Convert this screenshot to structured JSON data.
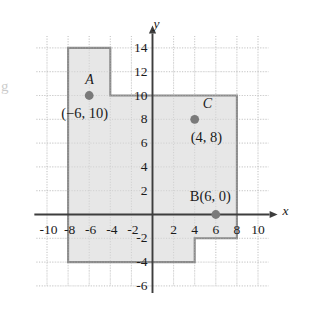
{
  "figure": {
    "axis_labels": {
      "x": "x",
      "y": "y"
    },
    "x_ticks": [
      "-10",
      "-8",
      "-6",
      "-4",
      "-2",
      "2",
      "4",
      "6",
      "8",
      "10"
    ],
    "y_ticks": [
      "14",
      "12",
      "10",
      "8",
      "6",
      "4",
      "2",
      "-2",
      "-4",
      "-6"
    ],
    "colors": {
      "shade_fill": "#e6e6e6",
      "polygon_stroke": "#8a8a8a",
      "axis": "#3d3d3d",
      "grid": "#c8c8c8",
      "point": "#7a7a7a",
      "text": "#1a1a1a"
    },
    "points": [
      {
        "name": "A",
        "coord_label": "(−6, 10)",
        "x": -6,
        "y": 10
      },
      {
        "name": "C",
        "coord_label": "(4, 8)",
        "x": 4,
        "y": 8
      },
      {
        "name": "B(6, 0)",
        "coord_label": "",
        "x": 6,
        "y": 0
      }
    ]
  },
  "chart_data": {
    "type": "scatter",
    "title": "",
    "xlabel": "x",
    "ylabel": "y",
    "xlim": [
      -11,
      11
    ],
    "ylim": [
      -6,
      15
    ],
    "xticks": [
      -10,
      -8,
      -6,
      -4,
      -2,
      2,
      4,
      6,
      8,
      10
    ],
    "yticks": [
      14,
      12,
      10,
      8,
      6,
      4,
      2,
      -2,
      -4,
      -6
    ],
    "grid": true,
    "grid_step": 2,
    "legend": "none",
    "points": [
      {
        "label": "A",
        "annotation": "(−6, 10)",
        "x": -6,
        "y": 10
      },
      {
        "label": "C",
        "annotation": "(4, 8)",
        "x": 4,
        "y": 8
      },
      {
        "label": "B(6, 0)",
        "annotation": "",
        "x": 6,
        "y": 0
      }
    ],
    "shaded_region": {
      "name": "shaded-polygon",
      "vertices": [
        [
          -8,
          14
        ],
        [
          -4,
          14
        ],
        [
          -4,
          10
        ],
        [
          8,
          10
        ],
        [
          8,
          -2
        ],
        [
          4,
          -2
        ],
        [
          4,
          -4
        ],
        [
          -8,
          -4
        ]
      ]
    }
  }
}
